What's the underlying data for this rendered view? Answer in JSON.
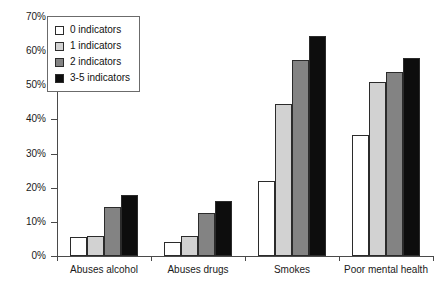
{
  "chart_data": {
    "type": "bar",
    "title": "",
    "xlabel": "",
    "ylabel": "",
    "ylim": [
      0,
      70
    ],
    "grid": false,
    "legend_position": "top-left",
    "categories": [
      "Abuses alcohol",
      "Abuses drugs",
      "Smokes",
      "Poor mental health"
    ],
    "ytick_labels": [
      "0%",
      "10%",
      "20%",
      "30%",
      "40%",
      "50%",
      "60%",
      "70%"
    ],
    "ytick_values": [
      0,
      10,
      20,
      30,
      40,
      50,
      60,
      70
    ],
    "series": [
      {
        "name": "0 indicators",
        "color": "#ffffff",
        "values": [
          5.5,
          4,
          22,
          35.5
        ]
      },
      {
        "name": "1 indicators",
        "color": "#d2d2d2",
        "values": [
          6,
          6,
          44.5,
          51
        ]
      },
      {
        "name": "2 indicators",
        "color": "#838383",
        "values": [
          14.5,
          12.5,
          57.5,
          54
        ]
      },
      {
        "name": "3-5 indicators",
        "color": "#0d0d0d",
        "values": [
          18,
          16,
          64.5,
          58
        ]
      }
    ]
  },
  "legend": {
    "items": [
      {
        "label": "0 indicators",
        "color": "#ffffff"
      },
      {
        "label": "1 indicators",
        "color": "#d2d2d2"
      },
      {
        "label": "2 indicators",
        "color": "#838383"
      },
      {
        "label": "3-5 indicators",
        "color": "#0d0d0d"
      }
    ]
  }
}
